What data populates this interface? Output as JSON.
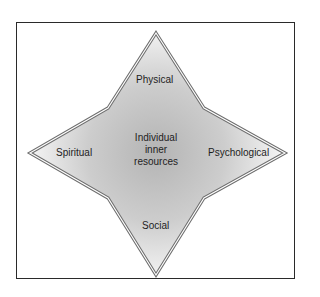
{
  "diagram": {
    "center_label_lines": [
      "Individual",
      "inner",
      "resources"
    ],
    "points": {
      "top": "Physical",
      "right": "Psychological",
      "bottom": "Social",
      "left": "Spiritual"
    }
  },
  "colors": {
    "frame_border": "#2a2a2a",
    "star_outline": "#6e6e6e",
    "fill_center": "#b4b4b4",
    "fill_edge": "#f4f4f4",
    "text": "#1e1e1e"
  }
}
